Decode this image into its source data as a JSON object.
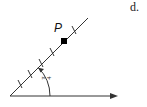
{
  "part_label": "d.",
  "point": {
    "label": "P"
  },
  "angle": {
    "label": "π/4",
    "numerator": "π",
    "denominator": "4"
  },
  "colors": {
    "stroke": "#333333",
    "point_fill": "#000000"
  }
}
